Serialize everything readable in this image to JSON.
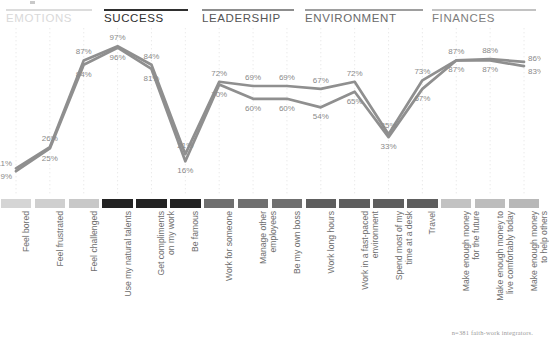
{
  "footnote": "n=381 faith-work integrators.",
  "categories": [
    {
      "name": "EMOTIONS",
      "color": "#d9d9d9",
      "rule": "#dcdcdc"
    },
    {
      "name": "SUCCESS",
      "color": "#2f2f2f",
      "rule": "#2f2f2f"
    },
    {
      "name": "LEADERSHIP",
      "color": "#555555",
      "rule": "#8d8d8d"
    },
    {
      "name": "ENVIRONMENT",
      "color": "#6a6a6a",
      "rule": "#9e9e9e"
    },
    {
      "name": "FINANCES",
      "color": "#7d7d7d",
      "rule": "#c2c2c2"
    }
  ],
  "chart_data": {
    "type": "line",
    "title": "",
    "xlabel": "",
    "ylabel": "",
    "ylim": [
      0,
      100
    ],
    "grid": "vertical-dotted",
    "legend": "none",
    "categories": [
      "Feel bored",
      "Feel frustrated",
      "Feel challenged",
      "Use my natural talents",
      "Get compliments\non my work",
      "Be famous",
      "Work for someone",
      "Manage other\nemployees",
      "Be my own boss",
      "Work long hours",
      "Work in a fast-paced\nenvironment",
      "Spend most of my\ntime at a desk",
      "Travel",
      "Make enough money\nfor the future",
      "Make enough money to\nlive comfortably today",
      "Make enough money\nto help others"
    ],
    "swatch_colors": [
      "#d5d5d5",
      "#cfcfcf",
      "#c8c8c8",
      "#232323",
      "#232323",
      "#232323",
      "#6f6f6f",
      "#6f6f6f",
      "#6f6f6f",
      "#5e5e5e",
      "#5e5e5e",
      "#5e5e5e",
      "#5e5e5e",
      "#c2c2c2",
      "#bdbdbd",
      "#b8b8b8"
    ],
    "series": [
      {
        "name": "upper",
        "color": "#8f8f8f",
        "values": [
          11,
          26,
          87,
          97,
          84,
          21,
          72,
          69,
          69,
          67,
          72,
          35,
          73,
          87,
          88,
          86
        ],
        "labels": [
          "11%",
          "26%",
          "87%",
          "97%",
          "84%",
          "21%",
          "72%",
          "69%",
          "69%",
          "67%",
          "72%",
          "35%",
          "73%",
          "87%",
          "88%",
          "86%"
        ]
      },
      {
        "name": "lower",
        "color": "#8f8f8f",
        "values": [
          9,
          25,
          84,
          96,
          81,
          16,
          70,
          60,
          60,
          54,
          65,
          33,
          67,
          87,
          87,
          83
        ],
        "labels": [
          "9%",
          "25%",
          "84%",
          "96%",
          "81%",
          "16%",
          "70%",
          "60%",
          "60%",
          "54%",
          "65%",
          "33%",
          "67%",
          "87%",
          "87%",
          "83%"
        ]
      }
    ]
  }
}
